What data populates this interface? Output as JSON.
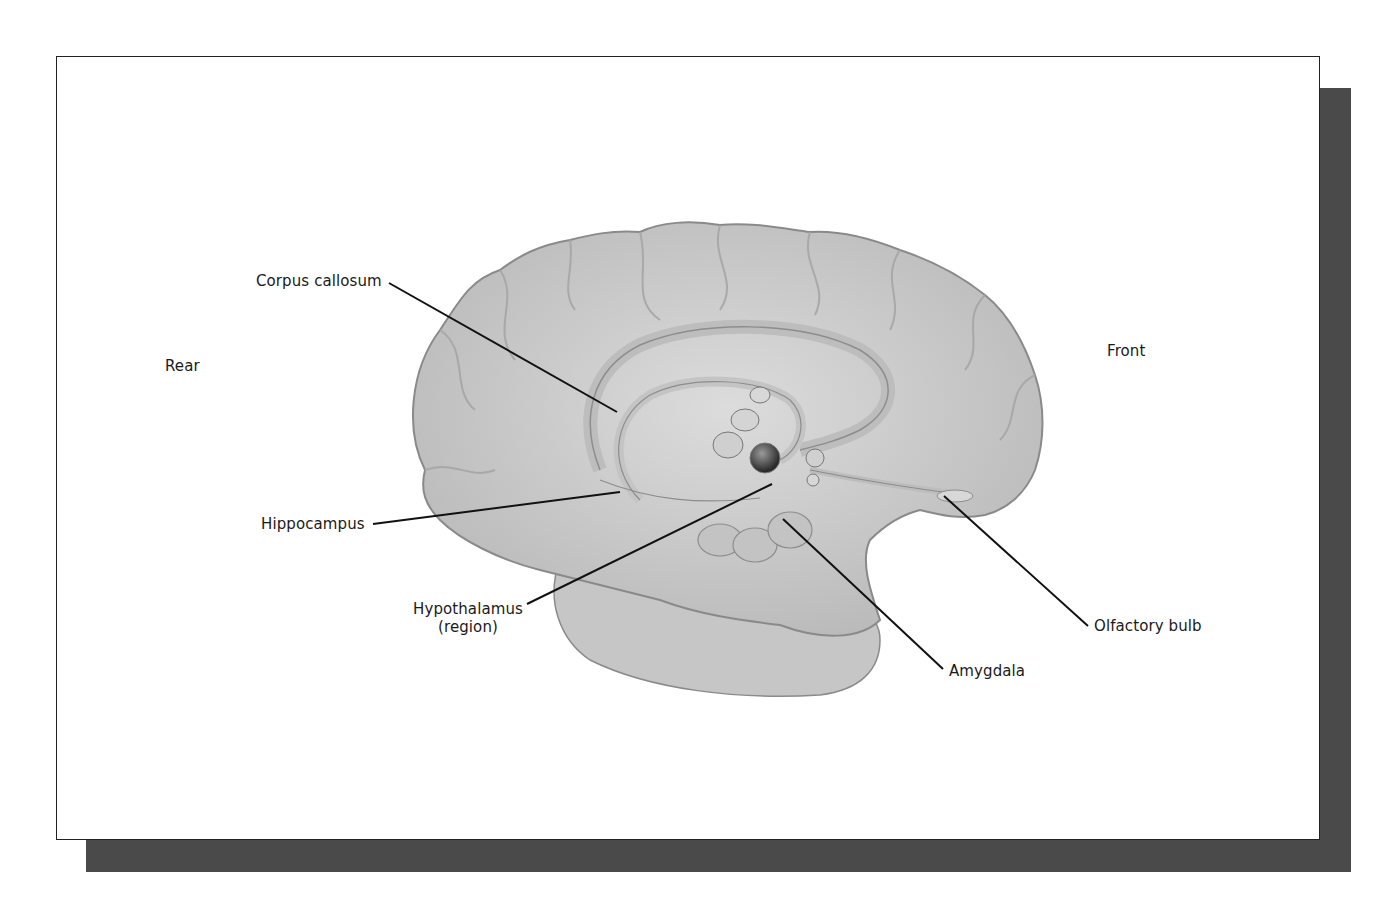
{
  "figure": {
    "orientation": {
      "rear": "Rear",
      "front": "Front"
    },
    "labels": [
      {
        "id": "corpus-callosum",
        "text": "Corpus callosum",
        "x": 256,
        "y": 272,
        "line": [
          389,
          283,
          617,
          412
        ]
      },
      {
        "id": "hippocampus",
        "text": "Hippocampus",
        "x": 261,
        "y": 515,
        "line": [
          373,
          524,
          620,
          492
        ]
      },
      {
        "id": "hypothalamus",
        "text": "Hypothalamus",
        "text2": "(region)",
        "x": 411,
        "y": 600,
        "line": [
          527,
          604,
          772,
          484
        ]
      },
      {
        "id": "amygdala",
        "text": "Amygdala",
        "x": 949,
        "y": 662,
        "line": [
          943,
          669,
          783,
          519
        ]
      },
      {
        "id": "olfactory-bulb",
        "text": "Olfactory bulb",
        "x": 1094,
        "y": 617,
        "line": [
          1088,
          626,
          944,
          496
        ]
      }
    ],
    "colors": {
      "brain_fill": "#c9c9c9",
      "brain_stroke": "#8a8a8a",
      "shadow": "#4a4a4a",
      "line": "#111111"
    }
  }
}
